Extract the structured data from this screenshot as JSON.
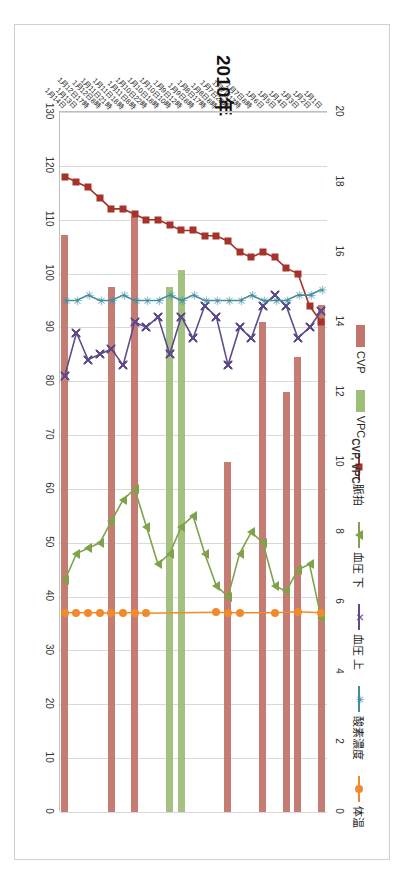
{
  "chart_data": {
    "type": "line",
    "title": "2010年",
    "orientation": "rotated-90-clockwise",
    "grid": true,
    "legend_position": "top",
    "axis_primary": {
      "label": "",
      "ticks": [
        130,
        120,
        110,
        100,
        90,
        80,
        70,
        60,
        50,
        40,
        30,
        20,
        10,
        0
      ],
      "range": [
        0,
        130
      ]
    },
    "axis_secondary": {
      "label": "CVP, VPC",
      "ticks": [
        20,
        18,
        16,
        14,
        12,
        10,
        8,
        6,
        4,
        2,
        0
      ],
      "range": [
        0,
        20
      ]
    },
    "categories": [
      "1月1日",
      "1月2日",
      "1月3日",
      "1月4日",
      "1月5日",
      "1月6日",
      "1月7日8時",
      "1月7日17時",
      "1月7日20時",
      "1月8日8時",
      "1月8日17時",
      "1月9日8時",
      "1月9日12時",
      "1月10日10時",
      "1月10日18時",
      "1月10日22時",
      "1月11日8時",
      "1月11日18時",
      "1月11日21時",
      "1月12日8時",
      "1月12日17時",
      "1月13日",
      "1月14日"
    ],
    "series": [
      {
        "name": "CVP",
        "type": "bar",
        "axis": "secondary",
        "color": "#c2756c",
        "values": [
          14.5,
          null,
          13.0,
          12.0,
          null,
          14.0,
          null,
          null,
          10.0,
          null,
          null,
          null,
          null,
          null,
          null,
          null,
          17.0,
          null,
          15.0,
          null,
          null,
          null,
          16.5
        ]
      },
      {
        "name": "VPC",
        "type": "bar",
        "axis": "secondary",
        "color": "#9fbe7a",
        "values": [
          null,
          null,
          null,
          null,
          null,
          null,
          null,
          null,
          null,
          null,
          null,
          null,
          15.5,
          15.0,
          null,
          null,
          null,
          null,
          null,
          null,
          null,
          null,
          null
        ]
      },
      {
        "name": "脈拍",
        "type": "line",
        "axis": "primary",
        "color": "#a5332a",
        "marker": "square",
        "values": [
          91,
          94,
          100,
          101,
          103,
          104,
          103,
          104,
          106,
          107,
          107,
          108,
          108,
          109,
          110,
          110,
          111,
          112,
          112,
          114,
          116,
          117,
          118
        ]
      },
      {
        "name": "血圧 下",
        "type": "line",
        "axis": "primary",
        "color": "#7fa34a",
        "marker": "triangle",
        "values": [
          36,
          46,
          45,
          41,
          42,
          50,
          52,
          48,
          40,
          42,
          48,
          55,
          53,
          48,
          46,
          53,
          60,
          58,
          54,
          50,
          49,
          48,
          43
        ]
      },
      {
        "name": "血圧 上",
        "type": "line",
        "axis": "primary",
        "color": "#5f4b8b",
        "marker": "x",
        "values": [
          93,
          90,
          88,
          94,
          96,
          94,
          88,
          90,
          83,
          92,
          94,
          88,
          92,
          85,
          92,
          90,
          91,
          83,
          86,
          85,
          84,
          89,
          81
        ]
      },
      {
        "name": "酸素濃度",
        "type": "line",
        "axis": "primary",
        "color": "#3f8ea0",
        "marker": "star",
        "values": [
          97,
          96,
          96,
          95,
          95,
          95,
          96,
          95,
          95,
          95,
          95,
          96,
          95,
          96,
          95,
          95,
          95,
          96,
          95,
          95,
          96,
          95,
          95
        ]
      },
      {
        "name": "体温",
        "type": "line",
        "axis": "primary",
        "color": "#f08a2c",
        "marker": "circle",
        "values": [
          37.0,
          null,
          37.2,
          null,
          37.0,
          null,
          null,
          37.0,
          37.0,
          37.1,
          null,
          null,
          null,
          null,
          null,
          36.9,
          37.0,
          37.0,
          36.9,
          37.0,
          37.0,
          37.0,
          37.0
        ]
      }
    ]
  },
  "legend": {
    "items": [
      {
        "label": "CVP",
        "swatch": "#c2756c",
        "kind": "bar",
        "icon": "bar-swatch"
      },
      {
        "label": "VPC",
        "swatch": "#9fbe7a",
        "kind": "bar",
        "icon": "bar-swatch"
      },
      {
        "label": "脈拍",
        "swatch": "#a5332a",
        "kind": "line",
        "icon": "square-marker"
      },
      {
        "label": "血圧 下",
        "swatch": "#7fa34a",
        "kind": "line",
        "icon": "triangle-marker"
      },
      {
        "label": "血圧 上",
        "swatch": "#5f4b8b",
        "kind": "line",
        "icon": "x-marker"
      },
      {
        "label": "酸素濃度",
        "swatch": "#3f8ea0",
        "kind": "line",
        "icon": "star-marker"
      },
      {
        "label": "体温",
        "swatch": "#f08a2c",
        "kind": "line",
        "icon": "circle-marker"
      }
    ]
  }
}
